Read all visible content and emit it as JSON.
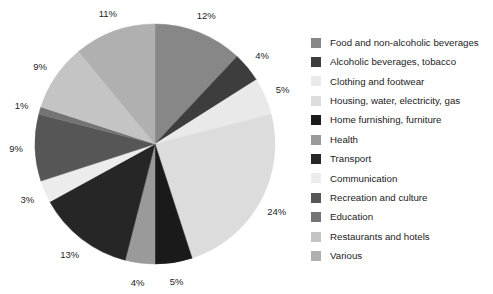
{
  "chart_data": {
    "type": "pie",
    "title": "",
    "subtitle": "",
    "xlabel": "",
    "ylabel": "",
    "units": "percent",
    "start_angle_deg": 0,
    "direction": "clockwise",
    "legend_position": "right",
    "grid": false,
    "categories": [
      "Food and non-alcoholic beverages",
      "Alcoholic beverages, tobacco",
      "Clothing and footwear",
      "Housing, water, electricity, gas",
      "Home furnishing, furniture",
      "Health",
      "Transport",
      "Communication",
      "Recreation and culture",
      "Education",
      "Restaurants and hotels",
      "Various"
    ],
    "values": [
      12,
      4,
      5,
      24,
      5,
      4,
      13,
      3,
      9,
      1,
      9,
      11
    ],
    "labels": [
      "12%",
      "4%",
      "5%",
      "24%",
      "5%",
      "4%",
      "13%",
      "3%",
      "9%",
      "1%",
      "9%",
      "11%"
    ],
    "colors": [
      "#878787",
      "#3d3d3d",
      "#e9e9e9",
      "#dcdcdc",
      "#1a1a1a",
      "#9a9a9a",
      "#262626",
      "#ececec",
      "#565656",
      "#747474",
      "#c4c4c4",
      "#b0b0b0"
    ]
  },
  "pie": {
    "center_x": 155,
    "center_y": 144,
    "radius": 120,
    "label_radius": 139
  },
  "legend": {
    "items": [
      {
        "label": "Food and non-alcoholic beverages",
        "color": "#878787"
      },
      {
        "label": "Alcoholic beverages, tobacco",
        "color": "#3d3d3d"
      },
      {
        "label": "Clothing and footwear",
        "color": "#e9e9e9"
      },
      {
        "label": "Housing, water, electricity, gas",
        "color": "#dcdcdc"
      },
      {
        "label": "Home furnishing, furniture",
        "color": "#1a1a1a"
      },
      {
        "label": "Health",
        "color": "#9a9a9a"
      },
      {
        "label": "Transport",
        "color": "#262626"
      },
      {
        "label": "Communication",
        "color": "#ececec"
      },
      {
        "label": "Recreation and culture",
        "color": "#565656"
      },
      {
        "label": "Education",
        "color": "#747474"
      },
      {
        "label": "Restaurants and hotels",
        "color": "#c4c4c4"
      },
      {
        "label": "Various",
        "color": "#b0b0b0"
      }
    ]
  }
}
